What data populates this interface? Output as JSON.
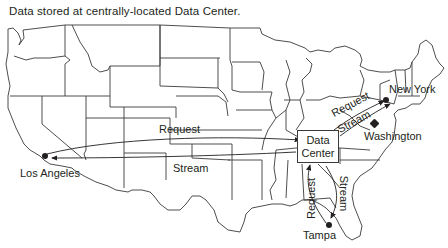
{
  "title": "Data stored at centrally-located Data Center.",
  "data_center": {
    "line1": "Data",
    "line2": "Center"
  },
  "cities": {
    "los_angeles": "Los Angeles",
    "new_york": "New York",
    "washington": "Washington",
    "tampa": "Tampa"
  },
  "flows": {
    "la_request": "Request",
    "la_stream": "Stream",
    "ny_request": "Request",
    "ny_stream": "Stream",
    "tampa_request": "Request",
    "tampa_stream": "Stream"
  },
  "colors": {
    "line": "#3a3a3a",
    "text": "#231f20",
    "background": "#ffffff"
  }
}
